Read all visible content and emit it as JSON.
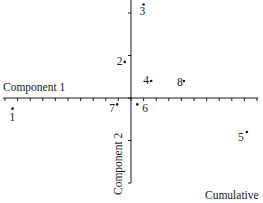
{
  "chart_data": {
    "type": "scatter",
    "title": "",
    "xlabel": "Component 1",
    "ylabel": "Component 2",
    "caption_fragment": "Cumulative",
    "grid": false,
    "legend": null,
    "axes": {
      "x_ticks_count": 21,
      "y_ticks_count": 5,
      "x_range_ticks": [
        -10,
        10
      ],
      "y_range_ticks": [
        -2,
        2.3
      ]
    },
    "points": [
      {
        "label": "1",
        "x": -9.4,
        "y": -0.25
      },
      {
        "label": "2",
        "x": -0.5,
        "y": 0.85
      },
      {
        "label": "3",
        "x": 1.0,
        "y": 2.2
      },
      {
        "label": "4",
        "x": 1.6,
        "y": 0.4
      },
      {
        "label": "5",
        "x": 9.2,
        "y": -0.8
      },
      {
        "label": "6",
        "x": 0.5,
        "y": -0.15
      },
      {
        "label": "7",
        "x": -1.1,
        "y": -0.15
      },
      {
        "label": "8",
        "x": 4.2,
        "y": 0.4
      }
    ]
  },
  "labels": {
    "x_axis": "Component 1",
    "y_axis": "Component 2",
    "corner": "Cumulative"
  }
}
